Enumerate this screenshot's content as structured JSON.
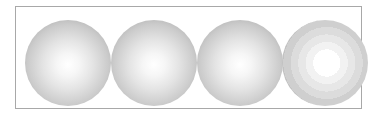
{
  "figure": {
    "frame_border_color": "#a8a8a8",
    "spheres": [
      {
        "style": "smooth-gradient",
        "highlight": "#ffffff",
        "edge": "#9a9a9a"
      },
      {
        "style": "smooth-gradient",
        "highlight": "#ffffff",
        "edge": "#9a9a9a"
      },
      {
        "style": "smooth-gradient",
        "highlight": "#ffffff",
        "edge": "#9a9a9a"
      },
      {
        "style": "banded-gradient",
        "highlight": "#ffffff",
        "edge": "#9c9c9c"
      }
    ]
  }
}
